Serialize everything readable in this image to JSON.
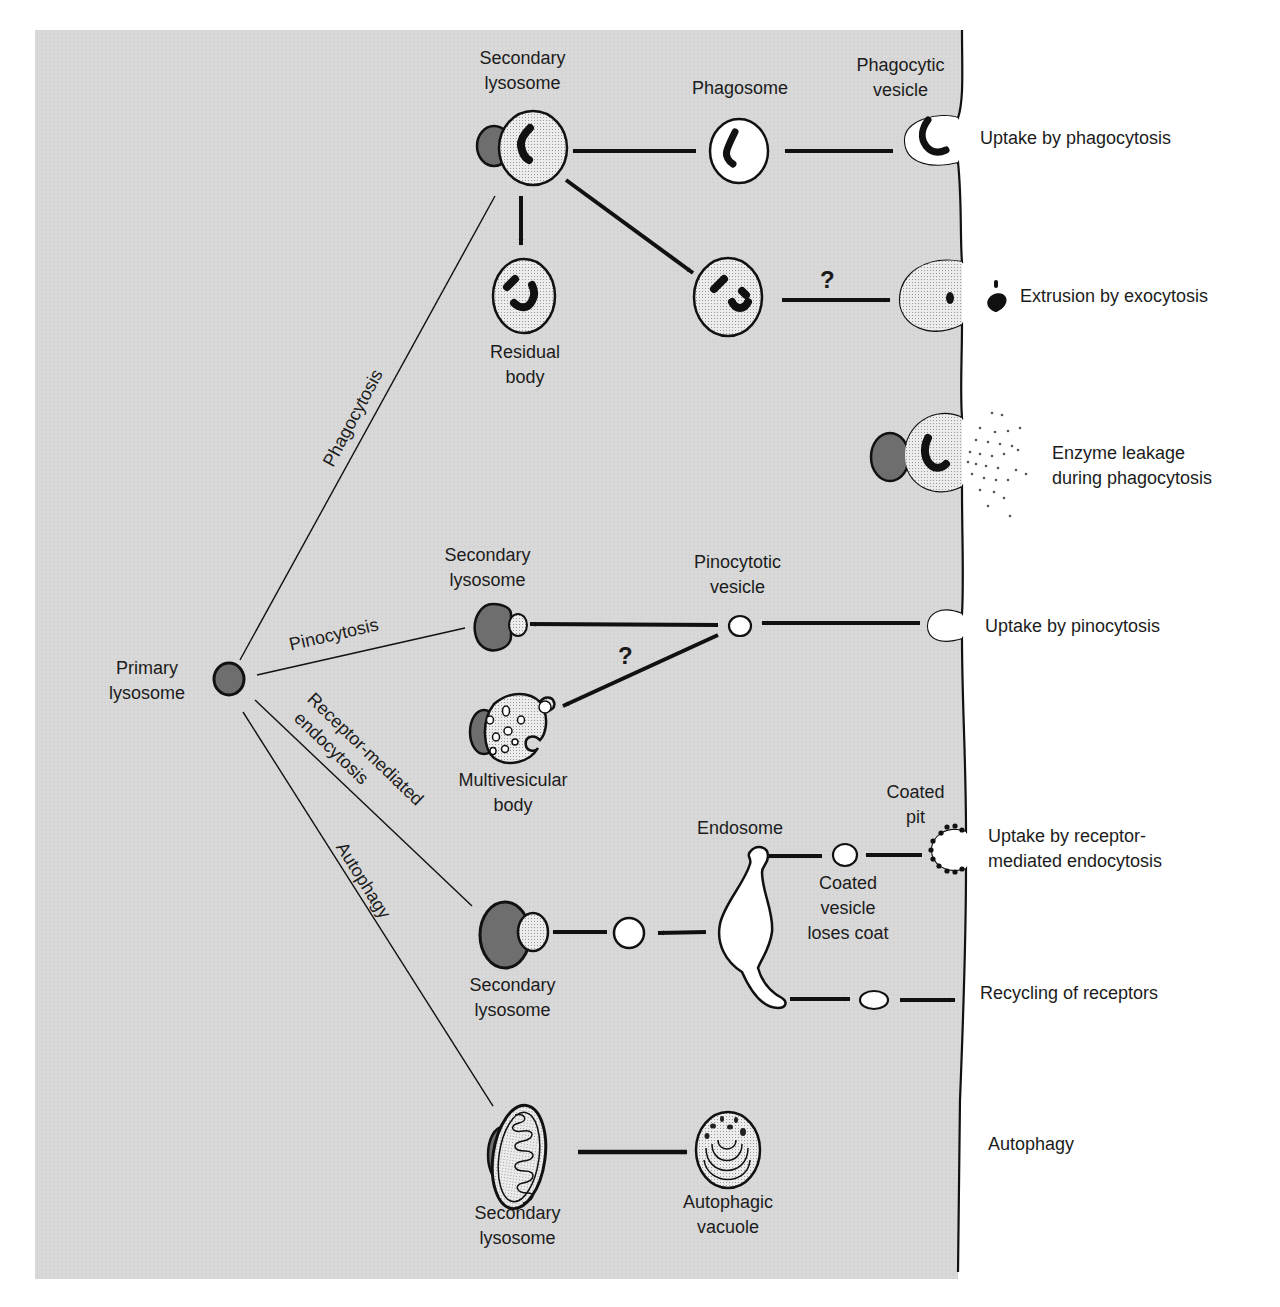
{
  "colors": {
    "cytoplasm": "#d6d6d6",
    "lysosome_dark": "#6e6e6e",
    "stipple": "#e4e4e4",
    "outline": "#111111",
    "background": "#ffffff"
  },
  "labels": {
    "primary_lysosome": [
      "Primary",
      "lysosome"
    ],
    "phago": {
      "secondary_lysosome": [
        "Secondary",
        "lysosome"
      ],
      "phagosome": "Phagosome",
      "phagocytic_vesicle": [
        "Phagocytic",
        "vesicle"
      ],
      "residual_body": [
        "Residual",
        "body"
      ],
      "question": "?"
    },
    "pino": {
      "secondary_lysosome": [
        "Secondary",
        "lysosome"
      ],
      "pinocytotic_vesicle": [
        "Pinocytotic",
        "vesicle"
      ],
      "multivesicular_body": [
        "Multivesicular",
        "body"
      ],
      "question": "?"
    },
    "rme": {
      "coated_pit": [
        "Coated",
        "pit"
      ],
      "endosome": "Endosome",
      "coated_vesicle": [
        "Coated",
        "vesicle",
        "loses coat"
      ],
      "secondary_lysosome": [
        "Secondary",
        "lysosome"
      ]
    },
    "auto": {
      "secondary_lysosome": [
        "Secondary",
        "lysosome"
      ],
      "autophagic_vacuole": [
        "Autophagic",
        "vacuole"
      ]
    }
  },
  "pathways": {
    "phagocytosis": "Phagocytosis",
    "pinocytosis": "Pinocytosis",
    "receptor_mediated": [
      "Receptor-mediated",
      "endocytosis"
    ],
    "autophagy": "Autophagy"
  },
  "outside_labels": {
    "uptake_phagocytosis": "Uptake by phagocytosis",
    "extrusion_exocytosis": "Extrusion by exocytosis",
    "enzyme_leakage": [
      "Enzyme leakage",
      "during phagocytosis"
    ],
    "uptake_pinocytosis": "Uptake by pinocytosis",
    "uptake_rme": [
      "Uptake by receptor-",
      "mediated endocytosis"
    ],
    "recycling": "Recycling of receptors",
    "autophagy": "Autophagy"
  }
}
